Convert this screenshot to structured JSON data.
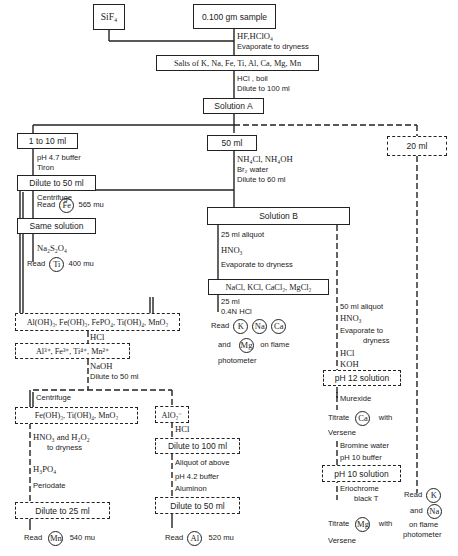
{
  "diagram": {
    "type": "flowchart",
    "nodes": {
      "sif4": "SiF₄",
      "sample": "0.100 gm sample",
      "salts": "Salts of K, Na, Fe, Ti, Al, Ca, Mg, Mn",
      "solution_a": "Solution A",
      "one_to_ten": "1 to 10 ml",
      "fifty_ml": "50 ml",
      "twenty_ml": "20 ml",
      "dilute_50_fe": "Dilute to 50 ml",
      "same_solution": "Same solution",
      "solution_b": "Solution B",
      "chlorides": "NaCl,  KCl,  CaCl₂,  MgCl₂",
      "hydroxides": "Al(OH)₃, Fe(OH)₃, FePO₄, Ti(OH)₄, MnO₂",
      "ions": "Al³⁺,  Fe³⁺,  Ti⁴⁺,   Mn²⁺",
      "fe_ti_mn": "Fe(OH)₃,  Ti(OH)₄,  MnO₂",
      "aluminate": "AlO₂⁻",
      "dilute_100": "Dilute to 100 ml",
      "dilute_25": "Dilute to 25 ml",
      "dilute_50_al": "Dilute to 50 ml",
      "ph12": "pH 12 solution",
      "ph10": "pH 10 solution"
    },
    "labels": {
      "hf": "HF,HClO₄",
      "evap1": "Evaporate to dryness",
      "hcl_boil": "HCl , boil",
      "dilute100": "Dilute to 100 ml",
      "ph47": "pH 4.7 buffer",
      "tiron": "Tiron",
      "read_fe_pre": "Read",
      "fe": "Fe",
      "fe_wl": "565 mu",
      "na2s2o4": "Na₂S₂O₄",
      "read_ti_pre": "Read",
      "ti": "Ti",
      "ti_wl": "400 mu",
      "nh4": "NH₄Cl, NH₄OH",
      "br2": "Br₂ water",
      "dilute60": "Dilute to 60 ml",
      "centrifuge1": "Centrifuge",
      "aliquot25": "25 ml aliquot",
      "hno3_b": "HNO₃",
      "evap_b": "Evaporate to dryness",
      "ml25": "25 ml",
      "hcl04": "0.4N HCl",
      "read_b": "Read",
      "k": "K",
      "na": "Na",
      "ca": "Ca",
      "and_b": "and",
      "mg": "Mg",
      "flame_b1": "on flame",
      "flame_b2": "photometer",
      "hcl_h": "HCl",
      "naoh": "NaOH",
      "dilute50n": "Dilute to 50 ml",
      "centrifuge2": "Centrifuge",
      "hno3h2o2": "HNO₃ and H₂O₂",
      "todry": "to dryness",
      "h3po4": "H₃PO₄",
      "periodate": "Periodate",
      "read_mn": "Read",
      "mn": "Mn",
      "mn_wl": "540 mu",
      "hcl_al": "HCl",
      "aliquot_above": "Aliquot of above",
      "ph42": "pH 4.2 buffer",
      "aluminon": "Aluminon",
      "read_al": "Read",
      "al": "Al",
      "al_wl": "520 mu",
      "aliquot50": "50 ml aliquot",
      "hno3_c": "HNO₃",
      "evap_c1": "Evaporate to",
      "evap_c2": "dryness",
      "hcl_c": "HCl",
      "koh": "KOH",
      "murexide": "Murexide",
      "titrate_ca": "Titrate",
      "with_ca": "with",
      "versene_ca": "Versene",
      "bromine": "Bromine water",
      "ph10buf": "pH 10 buffer",
      "erio1": "Eriochrome",
      "erio2": "black T",
      "titrate_mg": "Titrate",
      "with_mg": "with",
      "versene_mg": "Versene",
      "read_k": "Read",
      "and_na": "and",
      "flame_c1": "on flame",
      "flame_c2": "photometer"
    }
  }
}
